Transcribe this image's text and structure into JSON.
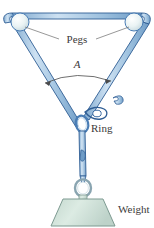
{
  "figure": {
    "type": "physics-statics-diagram",
    "labels": {
      "pegs": "Pegs",
      "angle": "A",
      "ring": "Ring",
      "weight": "Weight"
    },
    "colors": {
      "rope_fill": "#9dc0de",
      "rope_fill_light": "#c3dcef",
      "rope_outline": "#2f5d94",
      "peg_fill": "#e8f2f4",
      "peg_outline": "#4a7db5",
      "weight_fill": "#cfe0d8",
      "weight_outline": "#7d9a91",
      "label_text": "#3c3a3a",
      "leader_line": "#6b6b6b",
      "background": "#ffffff"
    },
    "elements": [
      {
        "name": "left-peg",
        "shape": "circle"
      },
      {
        "name": "right-peg",
        "shape": "circle"
      },
      {
        "name": "top-rope",
        "shape": "band"
      },
      {
        "name": "left-rope-leg",
        "shape": "band"
      },
      {
        "name": "right-rope-leg",
        "shape": "band"
      },
      {
        "name": "angle-arc",
        "shape": "arc-with-arrowheads"
      },
      {
        "name": "ring",
        "shape": "oval-link"
      },
      {
        "name": "vertical-rope",
        "shape": "band"
      },
      {
        "name": "weight-ring",
        "shape": "oval-link"
      },
      {
        "name": "weight-block",
        "shape": "trapezoid"
      }
    ]
  }
}
